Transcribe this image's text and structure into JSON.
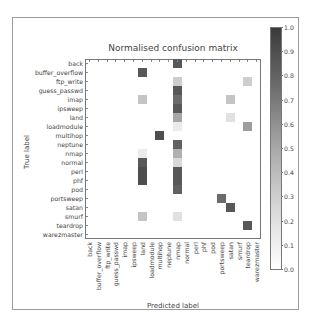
{
  "chart_data": {
    "type": "heatmap",
    "title": "Normalised confusion matrix",
    "xlabel": "Predicted label",
    "ylabel": "True label",
    "labels": [
      "back",
      "buffer_overflow",
      "ftp_write",
      "guess_passwd",
      "imap",
      "ipsweep",
      "land",
      "loadmodule",
      "multihop",
      "neptune",
      "nmap",
      "normal",
      "perl",
      "phf",
      "pod",
      "portsweep",
      "satan",
      "smurf",
      "teardrop",
      "warezmaster"
    ],
    "colorbar": {
      "min": 0.0,
      "max": 1.0,
      "ticks": [
        "0.0",
        "0.1",
        "0.2",
        "0.3",
        "0.4",
        "0.5",
        "0.6",
        "0.7",
        "0.8",
        "0.9",
        "1.0"
      ]
    },
    "cmap": "greys",
    "cells": [
      {
        "row": "back",
        "col": "nmap",
        "value": 0.85
      },
      {
        "row": "buffer_overflow",
        "col": "land",
        "value": 0.85
      },
      {
        "row": "ftp_write",
        "col": "nmap",
        "value": 0.25
      },
      {
        "row": "ftp_write",
        "col": "teardrop",
        "value": 0.25
      },
      {
        "row": "guess_passwd",
        "col": "nmap",
        "value": 0.85
      },
      {
        "row": "imap",
        "col": "land",
        "value": 0.3
      },
      {
        "row": "imap",
        "col": "nmap",
        "value": 0.75
      },
      {
        "row": "imap",
        "col": "satan",
        "value": 0.3
      },
      {
        "row": "ipsweep",
        "col": "nmap",
        "value": 0.85
      },
      {
        "row": "land",
        "col": "nmap",
        "value": 0.45
      },
      {
        "row": "land",
        "col": "satan",
        "value": 0.15
      },
      {
        "row": "loadmodule",
        "col": "nmap",
        "value": 0.1
      },
      {
        "row": "loadmodule",
        "col": "teardrop",
        "value": 0.5
      },
      {
        "row": "multihop",
        "col": "multihop",
        "value": 0.9
      },
      {
        "row": "neptune",
        "col": "nmap",
        "value": 0.8
      },
      {
        "row": "nmap",
        "col": "land",
        "value": 0.1
      },
      {
        "row": "nmap",
        "col": "nmap",
        "value": 0.4
      },
      {
        "row": "normal",
        "col": "land",
        "value": 0.85
      },
      {
        "row": "normal",
        "col": "nmap",
        "value": 0.2
      },
      {
        "row": "perl",
        "col": "land",
        "value": 0.9
      },
      {
        "row": "perl",
        "col": "nmap",
        "value": 0.85
      },
      {
        "row": "phf",
        "col": "land",
        "value": 0.9
      },
      {
        "row": "phf",
        "col": "nmap",
        "value": 0.85
      },
      {
        "row": "pod",
        "col": "nmap",
        "value": 0.8
      },
      {
        "row": "portsweep",
        "col": "portsweep",
        "value": 0.75
      },
      {
        "row": "satan",
        "col": "satan",
        "value": 0.85
      },
      {
        "row": "smurf",
        "col": "land",
        "value": 0.3
      },
      {
        "row": "smurf",
        "col": "nmap",
        "value": 0.15
      },
      {
        "row": "teardrop",
        "col": "teardrop",
        "value": 0.85
      }
    ],
    "grid": false,
    "legend_position": "right colorbar"
  }
}
